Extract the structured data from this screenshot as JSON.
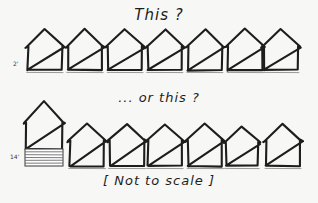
{
  "sketch": {
    "title_label": "This ?",
    "alternate_label": "... or this ?",
    "footer_label": "[ Not to scale ]",
    "ink_color": "#1d1d1d",
    "paper_color": "#f7f7f5",
    "rows": [
      {
        "id": "row-one",
        "caption": "This ?",
        "dimension_label": "2'",
        "house_count": 7,
        "houses": [
          {
            "index": 1,
            "x": 28,
            "width": 34,
            "body_height": 24,
            "roof_height": 17,
            "hatched_base": false
          },
          {
            "index": 2,
            "x": 68,
            "width": 34,
            "body_height": 24,
            "roof_height": 17,
            "hatched_base": false
          },
          {
            "index": 3,
            "x": 108,
            "width": 34,
            "body_height": 24,
            "roof_height": 17,
            "hatched_base": false
          },
          {
            "index": 4,
            "x": 148,
            "width": 34,
            "body_height": 24,
            "roof_height": 17,
            "hatched_base": false
          },
          {
            "index": 5,
            "x": 188,
            "width": 34,
            "body_height": 24,
            "roof_height": 17,
            "hatched_base": false
          },
          {
            "index": 6,
            "x": 228,
            "width": 34,
            "body_height": 24,
            "roof_height": 17,
            "hatched_base": false
          },
          {
            "index": 7,
            "x": 264,
            "width": 34,
            "body_height": 24,
            "roof_height": 17,
            "hatched_base": false
          }
        ]
      },
      {
        "id": "row-two",
        "caption": "... or this ?",
        "dimension_label": "14'",
        "house_count": 7,
        "houses": [
          {
            "index": 1,
            "x": 26,
            "width": 36,
            "body_height": 27,
            "roof_height": 21,
            "hatched_base": true,
            "hatch_lines": 6,
            "hatch_height": 17
          },
          {
            "index": 2,
            "x": 70,
            "width": 34,
            "body_height": 26,
            "roof_height": 16,
            "hatched_base": false
          },
          {
            "index": 3,
            "x": 110,
            "width": 34,
            "body_height": 26,
            "roof_height": 16,
            "hatched_base": false
          },
          {
            "index": 4,
            "x": 148,
            "width": 34,
            "body_height": 26,
            "roof_height": 16,
            "hatched_base": false
          },
          {
            "index": 5,
            "x": 188,
            "width": 34,
            "body_height": 26,
            "roof_height": 16,
            "hatched_base": false
          },
          {
            "index": 6,
            "x": 226,
            "width": 32,
            "body_height": 24,
            "roof_height": 15,
            "hatched_base": false
          },
          {
            "index": 7,
            "x": 266,
            "width": 34,
            "body_height": 26,
            "roof_height": 16,
            "hatched_base": false
          }
        ]
      }
    ]
  }
}
